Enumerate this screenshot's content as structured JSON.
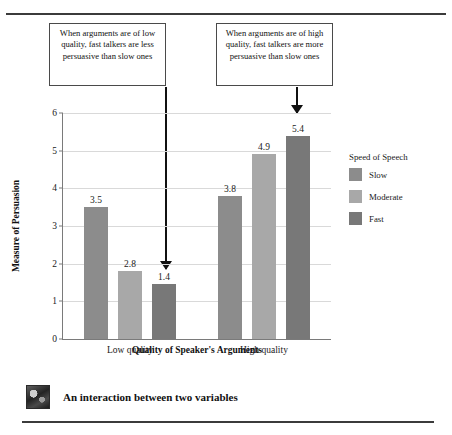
{
  "chart_data": {
    "type": "bar",
    "title": "",
    "xlabel": "Quality of Speaker's Arguments",
    "ylabel": "Measure of Persuasion",
    "categories": [
      "Low quality",
      "High quality"
    ],
    "ylim": [
      0,
      6
    ],
    "yticks": [
      "0",
      "1",
      "2",
      "3",
      "4",
      "5",
      "6"
    ],
    "grid": true,
    "legend_position": "right",
    "legend_title": "Speed of Speech",
    "series": [
      {
        "name": "Slow",
        "color": "#8c8c8c",
        "values": [
          3.5,
          3.8
        ],
        "labels": [
          "3.5",
          "3.8"
        ],
        "drawn_heights": [
          3.5,
          3.8
        ]
      },
      {
        "name": "Moderate",
        "color": "#a8a8a8",
        "values": [
          2.8,
          4.9
        ],
        "labels": [
          "2.8",
          "4.9"
        ],
        "drawn_heights": [
          1.8,
          4.9
        ]
      },
      {
        "name": "Fast",
        "color": "#787878",
        "values": [
          1.4,
          5.4
        ],
        "labels": [
          "1.4",
          "5.4"
        ],
        "drawn_heights": [
          1.45,
          5.4
        ]
      }
    ],
    "annotations": [
      {
        "name": "low-quality-callout",
        "text": "When arguments are of low quality, fast talkers are less persuasive than slow ones",
        "points_to": "Fast bar in Low quality group"
      },
      {
        "name": "high-quality-callout",
        "text": "When arguments are of high quality, fast talkers are more persuasive than slow ones",
        "points_to": "Fast bar in High quality group"
      }
    ]
  },
  "caption": {
    "text": "An interaction between two variables",
    "thumbnail": "photo-thumbnail"
  }
}
